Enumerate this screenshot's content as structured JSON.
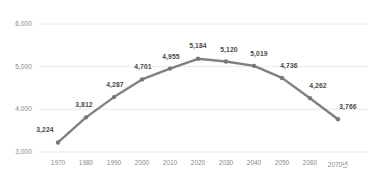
{
  "chart_data": {
    "type": "line",
    "title": "",
    "subtitle": "",
    "xlabel": "",
    "ylabel": "",
    "categories": [
      "1970",
      "1980",
      "1990",
      "2000",
      "2010",
      "2020",
      "2030",
      "2040",
      "2050",
      "2060",
      "2070년"
    ],
    "values": [
      3224,
      3812,
      4287,
      4701,
      4955,
      5184,
      5120,
      5019,
      4736,
      4262,
      3766
    ],
    "data_labels": [
      "3,224",
      "3,812",
      "4,287",
      "4,701",
      "4,955",
      "5,184",
      "5,120",
      "5,019",
      "4,736",
      "4,262",
      "3,766"
    ],
    "ylim": [
      3000,
      6000
    ],
    "yticks": [
      3000,
      4000,
      5000,
      6000
    ],
    "ytick_labels": [
      "3,000",
      "4,000",
      "5,000",
      "6,000"
    ],
    "grid": true,
    "legend": "none",
    "series": [
      {
        "name": "",
        "values": [
          3224,
          3812,
          4287,
          4701,
          4955,
          5184,
          5120,
          5019,
          4736,
          4262,
          3766
        ]
      }
    ],
    "colors": {
      "line": "#808080",
      "marker": "#787878",
      "grid": "#e8e8e8",
      "tick_text": "#8a8a8a",
      "label_text": "#4a4a4a",
      "background": "#ffffff"
    }
  }
}
